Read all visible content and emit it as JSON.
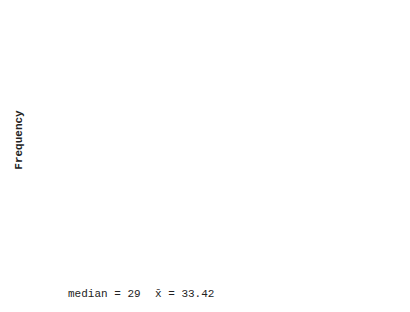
{
  "chart_data": {
    "type": "bar",
    "subtype": "histogram",
    "title": "",
    "xlabel": "",
    "ylabel": "Frequency",
    "bin_edges": [
      0.5,
      13.5,
      26.5,
      39.5,
      52.5,
      65.5,
      78.5,
      91.5,
      104.5,
      117.5,
      130.5
    ],
    "categories": [
      ".5-13.5",
      "13.5-26.5",
      "26.5-39.5",
      "39.5-52.5",
      "52.5-65.5",
      "65.5-78.5",
      "78.5-91.5",
      "91.5-104.5",
      "104.5-117.5",
      "117.5-130.5"
    ],
    "values": [
      16,
      25,
      32,
      13,
      5,
      3,
      3,
      1,
      1,
      1
    ],
    "x_tick_labels": [
      ".5",
      "13.5",
      "26.5",
      "39.5",
      "52.5",
      "65.5",
      "78.5",
      "91.5",
      "104.5",
      "117.5",
      "130.5"
    ],
    "y_tick_labels": [
      "10",
      "20",
      "30",
      "40"
    ],
    "y_minor_ticks": [
      5,
      15,
      25,
      35
    ],
    "ylim": [
      0,
      45
    ],
    "grid": false,
    "legend": null,
    "axis_break": true,
    "annotations": [
      {
        "label": "median = 29",
        "x": 29
      },
      {
        "label": "x̄ = 33.42",
        "x": 33.42
      }
    ]
  },
  "annotations": {
    "median_label": "median = 29",
    "mean_label": "x̄ = 33.42"
  },
  "axis": {
    "ylabel": "Frequency"
  }
}
